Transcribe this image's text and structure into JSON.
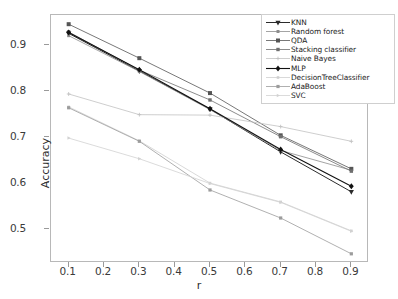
{
  "chart_data": {
    "type": "line",
    "title": "",
    "xlabel": "r",
    "ylabel": "Accuracy",
    "x": [
      0.1,
      0.3,
      0.5,
      0.7,
      0.9
    ],
    "xlim": [
      0.05,
      0.95
    ],
    "ylim": [
      0.425,
      0.965
    ],
    "xticks": [
      "0.1",
      "0.2",
      "0.3",
      "0.4",
      "0.5",
      "0.6",
      "0.7",
      "0.8",
      "0.9"
    ],
    "xtick_values": [
      0.1,
      0.2,
      0.3,
      0.4,
      0.5,
      0.6,
      0.7,
      0.8,
      0.9
    ],
    "yticks": [
      "0.5",
      "0.6",
      "0.7",
      "0.8",
      "0.9"
    ],
    "ytick_values": [
      0.5,
      0.6,
      0.7,
      0.8,
      0.9
    ],
    "grid": false,
    "legend_position": "upper right",
    "series": [
      {
        "name": "KNN",
        "marker": "triangle-down",
        "color": "#2b2b2b",
        "linewidth": 1.0,
        "markersize": 4.4,
        "values": [
          0.925,
          0.843,
          0.76,
          0.667,
          0.58
        ]
      },
      {
        "name": "Random forest",
        "marker": "square",
        "color": "#8d8d8d",
        "linewidth": 0.8,
        "markersize": 3.0,
        "values": [
          0.92,
          0.842,
          0.759,
          0.67,
          0.627
        ]
      },
      {
        "name": "QDA",
        "marker": "square",
        "color": "#555555",
        "linewidth": 0.8,
        "markersize": 4.0,
        "values": [
          0.945,
          0.871,
          0.795,
          0.703,
          0.63
        ]
      },
      {
        "name": "Stacking classifier",
        "marker": "square",
        "color": "#6f6f6f",
        "linewidth": 0.8,
        "markersize": 3.4,
        "values": [
          0.928,
          0.845,
          0.78,
          0.7,
          0.625
        ]
      },
      {
        "name": "Naive Bayes",
        "marker": "plus",
        "color": "#c2c2c2",
        "linewidth": 0.8,
        "markersize": 3.0,
        "values": [
          0.793,
          0.748,
          0.747,
          0.722,
          0.69
        ]
      },
      {
        "name": "MLP",
        "marker": "diamond",
        "color": "#111111",
        "linewidth": 1.1,
        "markersize": 4.6,
        "values": [
          0.927,
          0.846,
          0.761,
          0.672,
          0.592
        ]
      },
      {
        "name": "DecisionTreeClassifier",
        "marker": "square",
        "color": "#cfcfcf",
        "linewidth": 0.8,
        "markersize": 2.6,
        "values": [
          0.765,
          0.691,
          0.599,
          0.558,
          0.495
        ]
      },
      {
        "name": "AdaBoost",
        "marker": "square",
        "color": "#9c9c9c",
        "linewidth": 0.8,
        "markersize": 3.2,
        "values": [
          0.763,
          0.69,
          0.584,
          0.523,
          0.445
        ]
      },
      {
        "name": "SVC",
        "marker": "triangle-right",
        "color": "#d2d2d2",
        "linewidth": 0.8,
        "markersize": 3.0,
        "values": [
          0.697,
          0.652,
          0.598,
          0.557,
          0.494
        ]
      }
    ]
  }
}
